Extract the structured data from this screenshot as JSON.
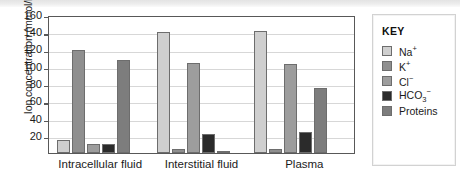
{
  "chart_data": {
    "type": "bar",
    "title": "",
    "xlabel": "",
    "ylabel": "Ion concentration (mmol/L)",
    "ylim": [
      0,
      160
    ],
    "yticks": [
      20,
      40,
      60,
      80,
      100,
      120,
      140,
      160
    ],
    "grid": true,
    "legend_position": "right",
    "categories": [
      "Intracellular fluid",
      "Interstitial fluid",
      "Plasma"
    ],
    "series": [
      {
        "name": "Na+",
        "label": "Na",
        "sup": "+",
        "sub": "",
        "color": "#cfcfcf",
        "values": [
          15,
          140,
          141
        ]
      },
      {
        "name": "K+",
        "label": "K",
        "sup": "+",
        "sub": "",
        "color": "#8f8f8f",
        "values": [
          120,
          5,
          5
        ]
      },
      {
        "name": "Cl-",
        "label": "Cl",
        "sup": "−",
        "sub": "",
        "color": "#9d9d9d",
        "values": [
          10,
          104,
          103
        ]
      },
      {
        "name": "HCO3-",
        "label": "HCO",
        "sup": "−",
        "sub": "3",
        "color": "#2b2b2b",
        "values": [
          10,
          22,
          24
        ]
      },
      {
        "name": "Proteins",
        "label": "Proteins",
        "sup": "",
        "sub": "",
        "color": "#7d7d7d",
        "values": [
          108,
          1,
          75
        ]
      }
    ]
  },
  "legend": {
    "title": "KEY"
  },
  "axis": {
    "y_title": "Ion concentration (mmol/L)",
    "tick_160": "160",
    "tick_140": "140",
    "tick_120": "120",
    "tick_100": "100",
    "tick_80": "80",
    "tick_60": "60",
    "tick_40": "40",
    "tick_20": "20"
  },
  "x_labels": {
    "g0": "Intracellular fluid",
    "g1": "Interstitial fluid",
    "g2": "Plasma"
  }
}
